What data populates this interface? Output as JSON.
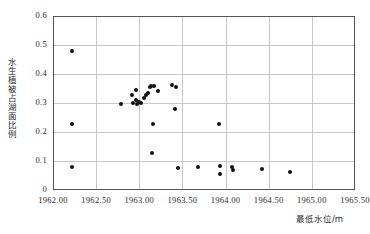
{
  "chart_data": {
    "type": "scatter",
    "title": "",
    "xlabel": "最低水位/m",
    "ylabel": "水生植被占湖面比例",
    "xlim": [
      1962.0,
      1965.5
    ],
    "ylim": [
      0,
      0.6
    ],
    "xticks": [
      "1962.00",
      "1962.50",
      "1963.00",
      "1963.50",
      "1964.00",
      "1964.50",
      "1965.00",
      "1965.50"
    ],
    "xtick_values": [
      1962.0,
      1962.5,
      1963.0,
      1963.5,
      1964.0,
      1964.5,
      1965.0,
      1965.5
    ],
    "yticks": [
      "0",
      "0.1",
      "0.2",
      "0.3",
      "0.4",
      "0.5",
      "0.6"
    ],
    "ytick_values": [
      0,
      0.1,
      0.2,
      0.3,
      0.4,
      0.5,
      0.6
    ],
    "grid": true,
    "legend": false,
    "marker_color": "#111111",
    "grid_color": "#c8c8c8",
    "frame_color": "#555555",
    "points": [
      {
        "x": 1962.22,
        "y": 0.478
      },
      {
        "x": 1962.22,
        "y": 0.228
      },
      {
        "x": 1962.22,
        "y": 0.079
      },
      {
        "x": 1962.79,
        "y": 0.298
      },
      {
        "x": 1962.92,
        "y": 0.327
      },
      {
        "x": 1962.93,
        "y": 0.3
      },
      {
        "x": 1962.96,
        "y": 0.345
      },
      {
        "x": 1962.96,
        "y": 0.309
      },
      {
        "x": 1962.97,
        "y": 0.298
      },
      {
        "x": 1963.0,
        "y": 0.302
      },
      {
        "x": 1963.02,
        "y": 0.3
      },
      {
        "x": 1963.06,
        "y": 0.318
      },
      {
        "x": 1963.08,
        "y": 0.327
      },
      {
        "x": 1963.1,
        "y": 0.336
      },
      {
        "x": 1963.12,
        "y": 0.355
      },
      {
        "x": 1963.13,
        "y": 0.36
      },
      {
        "x": 1963.16,
        "y": 0.228
      },
      {
        "x": 1963.17,
        "y": 0.358
      },
      {
        "x": 1963.22,
        "y": 0.34
      },
      {
        "x": 1963.15,
        "y": 0.129
      },
      {
        "x": 1963.38,
        "y": 0.363
      },
      {
        "x": 1963.42,
        "y": 0.355
      },
      {
        "x": 1963.41,
        "y": 0.278
      },
      {
        "x": 1963.45,
        "y": 0.075
      },
      {
        "x": 1963.68,
        "y": 0.079
      },
      {
        "x": 1963.92,
        "y": 0.228
      },
      {
        "x": 1963.93,
        "y": 0.082
      },
      {
        "x": 1963.93,
        "y": 0.055
      },
      {
        "x": 1964.08,
        "y": 0.079
      },
      {
        "x": 1964.09,
        "y": 0.07
      },
      {
        "x": 1964.42,
        "y": 0.073
      },
      {
        "x": 1964.75,
        "y": 0.062
      }
    ]
  }
}
